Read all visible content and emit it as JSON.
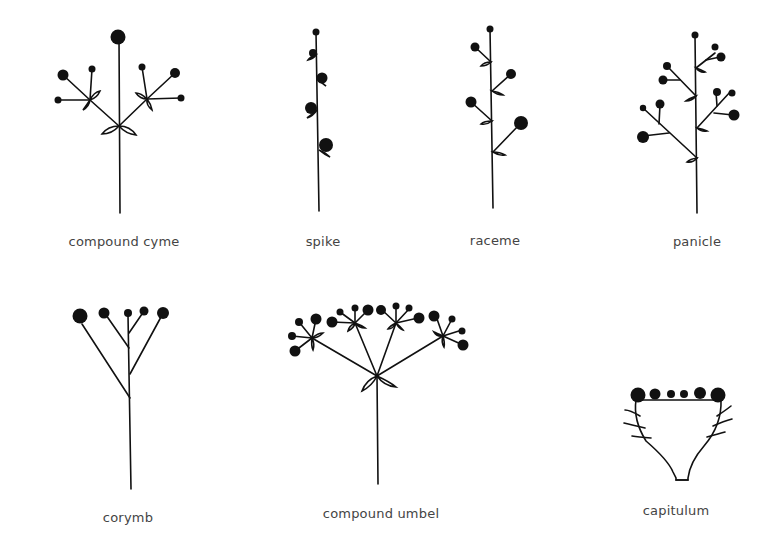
{
  "diagram": {
    "colors": {
      "ink": "#111111",
      "label": "#444444",
      "background": "#ffffff"
    },
    "items": [
      {
        "id": "compound-cyme",
        "label": "compound cyme"
      },
      {
        "id": "spike",
        "label": "spike"
      },
      {
        "id": "raceme",
        "label": "raceme"
      },
      {
        "id": "panicle",
        "label": "panicle"
      },
      {
        "id": "corymb",
        "label": "corymb"
      },
      {
        "id": "compound-umbel",
        "label": "compound umbel"
      },
      {
        "id": "capitulum",
        "label": "capitulum"
      }
    ]
  }
}
